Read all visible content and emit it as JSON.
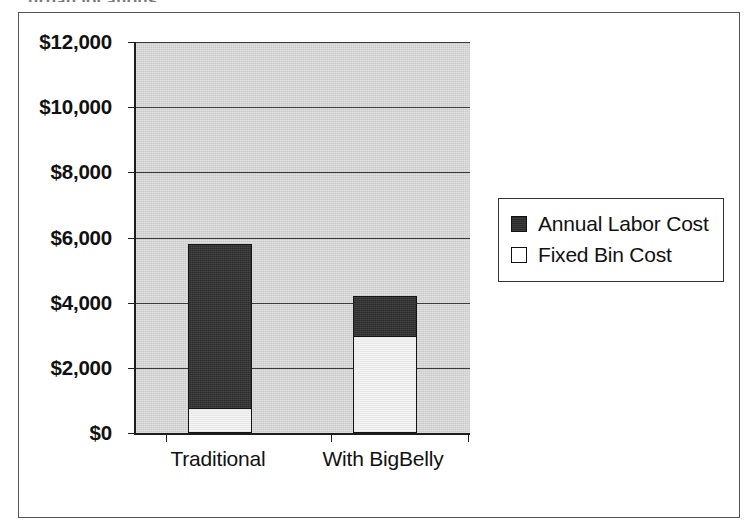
{
  "caption": {
    "text": "urban locations"
  },
  "chart_data": {
    "type": "bar",
    "subtype": "stacked-vertical",
    "title": "",
    "xlabel": "",
    "ylabel": "",
    "categories": [
      "Traditional",
      "With BigBelly"
    ],
    "series": [
      {
        "name": "Fixed Bin Cost",
        "values": [
          750,
          3000
        ],
        "color": "#f4f4f4"
      },
      {
        "name": "Annual Labor Cost",
        "values": [
          5050,
          1200
        ],
        "color": "#2b2b2b"
      }
    ],
    "totals": [
      5800,
      4200
    ],
    "stack_order_bottom_to_top": [
      "Fixed Bin Cost",
      "Annual Labor Cost"
    ],
    "ylim": [
      0,
      12000
    ],
    "ytick_step": 2000,
    "ytick_labels": [
      "$0",
      "$2,000",
      "$4,000",
      "$6,000",
      "$8,000",
      "$10,000",
      "$12,000"
    ],
    "ytick_values": [
      0,
      2000,
      4000,
      6000,
      8000,
      10000,
      12000
    ],
    "grid": true,
    "grid_axis": "y",
    "legend_position": "right",
    "legend_entries": [
      "Annual Labor Cost",
      "Fixed Bin Cost"
    ],
    "plot_background": "#c9c9c9"
  },
  "legend": {
    "items": [
      {
        "label": "Annual Labor Cost",
        "swatch": "dark"
      },
      {
        "label": "Fixed Bin Cost",
        "swatch": "light"
      }
    ]
  }
}
